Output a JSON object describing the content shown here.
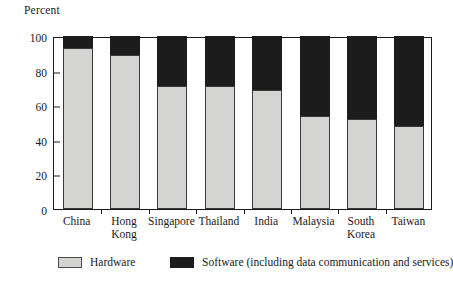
{
  "chart_data": {
    "type": "bar",
    "subtype": "stacked-bar-100-percent",
    "title": "",
    "ylabel": "Percent",
    "xlabel": "",
    "ylim": [
      0,
      100
    ],
    "yticks": [
      0,
      20,
      40,
      60,
      80,
      100
    ],
    "grid": false,
    "legend_position": "bottom",
    "categories": [
      "China",
      "Hong Kong",
      "Singapore",
      "Thailand",
      "India",
      "Malaysia",
      "South Korea",
      "Taiwan"
    ],
    "series": [
      {
        "name": "Hardware",
        "color": "#d4d4d2",
        "values": [
          93,
          89,
          71,
          71,
          69,
          54,
          52,
          48
        ]
      },
      {
        "name": "Software (including data communication and services)",
        "color": "#1c1c1c",
        "values": [
          7,
          11,
          29,
          29,
          31,
          46,
          48,
          52
        ]
      }
    ]
  },
  "axis": {
    "y_title": "Percent",
    "tick_labels": [
      "100",
      "80",
      "60",
      "40",
      "20",
      "0"
    ],
    "category_labels": [
      "China",
      "Hong\nKong",
      "Singapore",
      "Thailand",
      "India",
      "Malaysia",
      "South\nKorea",
      "Taiwan"
    ]
  },
  "legend": {
    "entries": [
      {
        "label": "Hardware",
        "swatch": "light-gray-square",
        "color": "#d4d4d2"
      },
      {
        "label": "Software (including data communication and services)",
        "swatch": "black-square",
        "color": "#1c1c1c"
      }
    ]
  }
}
